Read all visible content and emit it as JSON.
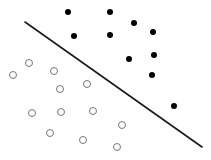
{
  "chart_data": {
    "type": "scatter",
    "title": "",
    "subtitle": "",
    "xlabel": "",
    "ylabel": "",
    "xlim": [
      0,
      211
    ],
    "ylim": [
      0,
      160
    ],
    "grid": false,
    "axes_visible": false,
    "tick_labels_x": [],
    "tick_labels_y": [],
    "legend": [],
    "legend_position": "none",
    "annotations": [],
    "background_color": "#ffffff",
    "series": [
      {
        "name": "class-positive",
        "marker": "filled-circle",
        "marker_size": 6,
        "color": "#000000",
        "points": [
          {
            "x": 68,
            "y": 12
          },
          {
            "x": 110,
            "y": 12
          },
          {
            "x": 74,
            "y": 36
          },
          {
            "x": 110,
            "y": 35
          },
          {
            "x": 134,
            "y": 23
          },
          {
            "x": 153,
            "y": 32
          },
          {
            "x": 129,
            "y": 59
          },
          {
            "x": 154,
            "y": 55
          },
          {
            "x": 152,
            "y": 75
          },
          {
            "x": 174,
            "y": 106
          }
        ]
      },
      {
        "name": "class-negative",
        "marker": "open-circle",
        "marker_size": 7,
        "color": "#777777",
        "points": [
          {
            "x": 29,
            "y": 63
          },
          {
            "x": 13,
            "y": 75
          },
          {
            "x": 54,
            "y": 71
          },
          {
            "x": 87,
            "y": 84
          },
          {
            "x": 60,
            "y": 89
          },
          {
            "x": 32,
            "y": 113
          },
          {
            "x": 61,
            "y": 112
          },
          {
            "x": 93,
            "y": 111
          },
          {
            "x": 50,
            "y": 133
          },
          {
            "x": 83,
            "y": 140
          },
          {
            "x": 122,
            "y": 125
          },
          {
            "x": 117,
            "y": 147
          }
        ]
      }
    ],
    "lines": [
      {
        "name": "decision-boundary",
        "color": "#1a1a1a",
        "width": 1.6,
        "x1": 25,
        "y1": 22,
        "x2": 202,
        "y2": 147
      }
    ]
  }
}
